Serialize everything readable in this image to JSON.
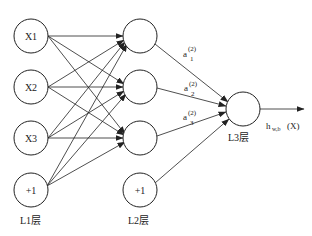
{
  "diagram": {
    "colors": {
      "line": "#222222",
      "background": "#ffffff"
    },
    "layers": [
      {
        "name": "L1层",
        "nodes": [
          "X1",
          "X2",
          "X3",
          "+1"
        ]
      },
      {
        "name": "L2层",
        "nodes": [
          "",
          "",
          "",
          "+1"
        ]
      },
      {
        "name": "L3层",
        "nodes": [
          ""
        ]
      }
    ],
    "activations": [
      {
        "base": "a",
        "sup": "(2)",
        "sub": "1"
      },
      {
        "base": "a",
        "sup": "(2)",
        "sub": "2"
      },
      {
        "base": "a",
        "sup": "(2)",
        "sub": "3"
      }
    ],
    "output": {
      "base": "h",
      "sub": "w,b",
      "arg": "(X)"
    }
  }
}
